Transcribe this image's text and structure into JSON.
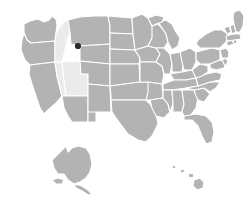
{
  "map": {
    "title": "United States choropleth map",
    "projection": "albers-usa",
    "width": 247,
    "height": 206,
    "background_color": "#ffffff",
    "default_state_color": "#b3b3b3",
    "highlight_state_color": "#ebebeb",
    "border_color": "#ffffff",
    "marker_color": "#2b2b2b",
    "legend_visible": false,
    "labels_visible": false,
    "highlighted_regions": [
      "Idaho",
      "Nevada",
      "Utah"
    ],
    "marker": {
      "name": "location-marker",
      "x": 78,
      "y": 46,
      "radius": 3.1,
      "color": "#2b2b2b",
      "near_region": "Montana / Idaho border"
    },
    "insets": [
      {
        "name": "alaska-inset",
        "label": "Alaska",
        "color": "#b3b3b3"
      },
      {
        "name": "hawaii-inset",
        "label": "Hawaii",
        "color": "#b3b3b3"
      }
    ],
    "states": [
      {
        "code": "WA",
        "name": "Washington",
        "color": "#b3b3b3"
      },
      {
        "code": "OR",
        "name": "Oregon",
        "color": "#b3b3b3"
      },
      {
        "code": "CA",
        "name": "California",
        "color": "#b3b3b3"
      },
      {
        "code": "ID",
        "name": "Idaho",
        "color": "#ebebeb"
      },
      {
        "code": "NV",
        "name": "Nevada",
        "color": "#ebebeb"
      },
      {
        "code": "UT",
        "name": "Utah",
        "color": "#ebebeb"
      },
      {
        "code": "AZ",
        "name": "Arizona",
        "color": "#b3b3b3"
      },
      {
        "code": "MT",
        "name": "Montana",
        "color": "#b3b3b3"
      },
      {
        "code": "WY",
        "name": "Wyoming",
        "color": "#b3b3b3"
      },
      {
        "code": "CO",
        "name": "Colorado",
        "color": "#b3b3b3"
      },
      {
        "code": "NM",
        "name": "New Mexico",
        "color": "#b3b3b3"
      },
      {
        "code": "ND",
        "name": "North Dakota",
        "color": "#b3b3b3"
      },
      {
        "code": "SD",
        "name": "South Dakota",
        "color": "#b3b3b3"
      },
      {
        "code": "NE",
        "name": "Nebraska",
        "color": "#b3b3b3"
      },
      {
        "code": "KS",
        "name": "Kansas",
        "color": "#b3b3b3"
      },
      {
        "code": "OK",
        "name": "Oklahoma",
        "color": "#b3b3b3"
      },
      {
        "code": "TX",
        "name": "Texas",
        "color": "#b3b3b3"
      },
      {
        "code": "MN",
        "name": "Minnesota",
        "color": "#b3b3b3"
      },
      {
        "code": "IA",
        "name": "Iowa",
        "color": "#b3b3b3"
      },
      {
        "code": "MO",
        "name": "Missouri",
        "color": "#b3b3b3"
      },
      {
        "code": "AR",
        "name": "Arkansas",
        "color": "#b3b3b3"
      },
      {
        "code": "LA",
        "name": "Louisiana",
        "color": "#b3b3b3"
      },
      {
        "code": "WI",
        "name": "Wisconsin",
        "color": "#b3b3b3"
      },
      {
        "code": "IL",
        "name": "Illinois",
        "color": "#b3b3b3"
      },
      {
        "code": "MS",
        "name": "Mississippi",
        "color": "#b3b3b3"
      },
      {
        "code": "MI",
        "name": "Michigan",
        "color": "#b3b3b3"
      },
      {
        "code": "IN",
        "name": "Indiana",
        "color": "#b3b3b3"
      },
      {
        "code": "KY",
        "name": "Kentucky",
        "color": "#b3b3b3"
      },
      {
        "code": "TN",
        "name": "Tennessee",
        "color": "#b3b3b3"
      },
      {
        "code": "AL",
        "name": "Alabama",
        "color": "#b3b3b3"
      },
      {
        "code": "OH",
        "name": "Ohio",
        "color": "#b3b3b3"
      },
      {
        "code": "GA",
        "name": "Georgia",
        "color": "#b3b3b3"
      },
      {
        "code": "FL",
        "name": "Florida",
        "color": "#b3b3b3"
      },
      {
        "code": "SC",
        "name": "South Carolina",
        "color": "#b3b3b3"
      },
      {
        "code": "NC",
        "name": "North Carolina",
        "color": "#b3b3b3"
      },
      {
        "code": "VA",
        "name": "Virginia",
        "color": "#b3b3b3"
      },
      {
        "code": "WV",
        "name": "West Virginia",
        "color": "#b3b3b3"
      },
      {
        "code": "PA",
        "name": "Pennsylvania",
        "color": "#b3b3b3"
      },
      {
        "code": "NY",
        "name": "New York",
        "color": "#b3b3b3"
      },
      {
        "code": "MD",
        "name": "Maryland",
        "color": "#b3b3b3"
      },
      {
        "code": "DE",
        "name": "Delaware",
        "color": "#b3b3b3"
      },
      {
        "code": "NJ",
        "name": "New Jersey",
        "color": "#b3b3b3"
      },
      {
        "code": "CT",
        "name": "Connecticut",
        "color": "#b3b3b3"
      },
      {
        "code": "RI",
        "name": "Rhode Island",
        "color": "#b3b3b3"
      },
      {
        "code": "MA",
        "name": "Massachusetts",
        "color": "#b3b3b3"
      },
      {
        "code": "VT",
        "name": "Vermont",
        "color": "#b3b3b3"
      },
      {
        "code": "NH",
        "name": "New Hampshire",
        "color": "#b3b3b3"
      },
      {
        "code": "ME",
        "name": "Maine",
        "color": "#b3b3b3"
      },
      {
        "code": "AK",
        "name": "Alaska",
        "color": "#b3b3b3"
      },
      {
        "code": "HI",
        "name": "Hawaii",
        "color": "#b3b3b3"
      }
    ]
  }
}
